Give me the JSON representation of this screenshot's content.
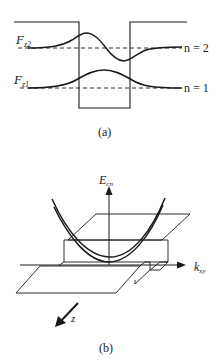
{
  "panel_a": {
    "caption": "(a)",
    "level_labels": {
      "upper": "F",
      "upper_sub": "z2",
      "lower": "F",
      "lower_sub": "z1"
    },
    "n_labels": {
      "upper": "n = 2",
      "lower": "n = 1"
    }
  },
  "panel_b": {
    "caption": "(b)",
    "y_axis_label": "E",
    "y_axis_sub": "cn",
    "x_axis_label": "k",
    "x_axis_sub": "xy",
    "z_label": "z"
  },
  "colors": {
    "stroke": "#1a1a1a",
    "background": "#ffffff"
  }
}
